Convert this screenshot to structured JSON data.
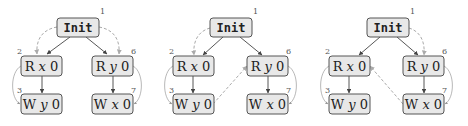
{
  "diagrams": [
    {
      "nodes": {
        "init": {
          "label": "Init",
          "num": "1"
        },
        "a": {
          "op": "R",
          "var": "x",
          "val": "0",
          "num": "2"
        },
        "b": {
          "op": "W",
          "var": "y",
          "val": "0",
          "num": "3"
        },
        "c": {
          "op": "R",
          "var": "y",
          "val": "0",
          "num": "6"
        },
        "d": {
          "op": "W",
          "var": "x",
          "val": "0",
          "num": "7"
        }
      },
      "dashed_edges": [
        "Init->R x 0",
        "Init->R y 0"
      ]
    },
    {
      "nodes": {
        "init": {
          "label": "Init",
          "num": "1"
        },
        "a": {
          "op": "R",
          "var": "x",
          "val": "0",
          "num": "2"
        },
        "b": {
          "op": "W",
          "var": "y",
          "val": "0",
          "num": "3"
        },
        "c": {
          "op": "R",
          "var": "y",
          "val": "0",
          "num": "6"
        },
        "d": {
          "op": "W",
          "var": "x",
          "val": "0",
          "num": "7"
        }
      },
      "dashed_edges": [
        "Init->R x 0",
        "W y 0->R y 0"
      ]
    },
    {
      "nodes": {
        "init": {
          "label": "Init",
          "num": "1"
        },
        "a": {
          "op": "R",
          "var": "x",
          "val": "0",
          "num": "2"
        },
        "b": {
          "op": "W",
          "var": "y",
          "val": "0",
          "num": "3"
        },
        "c": {
          "op": "R",
          "var": "y",
          "val": "0",
          "num": "6"
        },
        "d": {
          "op": "W",
          "var": "x",
          "val": "0",
          "num": "7"
        }
      },
      "dashed_edges": [
        "Init->R y 0",
        "W x 0->R x 0"
      ]
    }
  ],
  "colors": {
    "node_fill": "#e8e8e8",
    "node_stroke": "#555555",
    "dashed": "#aaaaaa",
    "edge": "#444444"
  }
}
